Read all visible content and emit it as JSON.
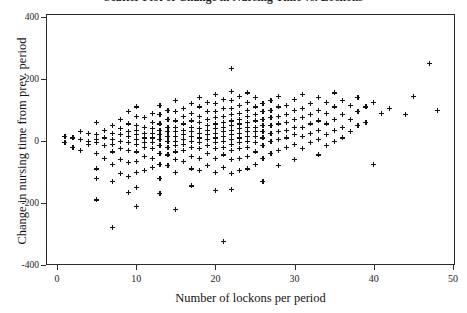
{
  "chart_data": {
    "type": "scatter",
    "title": "Scatter Plot of Change in Nursing Time vs. Lockons",
    "xlabel": "Number of lockons per period",
    "ylabel": "Change in nursing time from prev. period",
    "xlim": [
      -2,
      51.5
    ],
    "ylim": [
      -430,
      430
    ],
    "xticks": [
      0,
      10,
      20,
      30,
      40,
      50
    ],
    "yticks": [
      400,
      200,
      0,
      -200,
      -400
    ],
    "xticklabels": [
      "0",
      "10",
      "20",
      "30",
      "40",
      "50"
    ],
    "yticklabels": [
      "400",
      "200",
      "0",
      "-200",
      "-400"
    ],
    "grid": false,
    "legend": null,
    "marker": "plus",
    "marker_color": "#121212",
    "marker_size": 5,
    "background": "#ffffff",
    "frame_color": "#2b2b2b",
    "n_points": 298,
    "points": [
      [
        1,
        15
      ],
      [
        1,
        -5
      ],
      [
        2,
        10
      ],
      [
        2,
        -20
      ],
      [
        3,
        30
      ],
      [
        3,
        5
      ],
      [
        3,
        -30
      ],
      [
        4,
        25
      ],
      [
        4,
        0
      ],
      [
        4,
        -10
      ],
      [
        5,
        60
      ],
      [
        5,
        20
      ],
      [
        5,
        5
      ],
      [
        5,
        -5
      ],
      [
        5,
        -40
      ],
      [
        5,
        -90
      ],
      [
        5,
        -120
      ],
      [
        5,
        -190
      ],
      [
        6,
        35
      ],
      [
        6,
        10
      ],
      [
        6,
        -15
      ],
      [
        6,
        -55
      ],
      [
        7,
        50
      ],
      [
        7,
        25
      ],
      [
        7,
        5
      ],
      [
        7,
        -10
      ],
      [
        7,
        -35
      ],
      [
        7,
        -75
      ],
      [
        7,
        -130
      ],
      [
        7,
        -280
      ],
      [
        8,
        70
      ],
      [
        8,
        40
      ],
      [
        8,
        20
      ],
      [
        8,
        0
      ],
      [
        8,
        -25
      ],
      [
        8,
        -60
      ],
      [
        8,
        -105
      ],
      [
        9,
        95
      ],
      [
        9,
        55
      ],
      [
        9,
        30
      ],
      [
        9,
        15
      ],
      [
        9,
        -5
      ],
      [
        9,
        -30
      ],
      [
        9,
        -70
      ],
      [
        9,
        -115
      ],
      [
        9,
        -165
      ],
      [
        10,
        110
      ],
      [
        10,
        80
      ],
      [
        10,
        50
      ],
      [
        10,
        35
      ],
      [
        10,
        20
      ],
      [
        10,
        5
      ],
      [
        10,
        -10
      ],
      [
        10,
        -35
      ],
      [
        10,
        -65
      ],
      [
        10,
        -100
      ],
      [
        10,
        -150
      ],
      [
        10,
        -210
      ],
      [
        11,
        75
      ],
      [
        11,
        45
      ],
      [
        11,
        25
      ],
      [
        11,
        10
      ],
      [
        11,
        -5
      ],
      [
        11,
        -20
      ],
      [
        11,
        -50
      ],
      [
        11,
        -95
      ],
      [
        12,
        90
      ],
      [
        12,
        60
      ],
      [
        12,
        40
      ],
      [
        12,
        25
      ],
      [
        12,
        10
      ],
      [
        12,
        -5
      ],
      [
        12,
        -25
      ],
      [
        12,
        -55
      ],
      [
        12,
        -85
      ],
      [
        13,
        115
      ],
      [
        13,
        85
      ],
      [
        13,
        55
      ],
      [
        13,
        35
      ],
      [
        13,
        20
      ],
      [
        13,
        5
      ],
      [
        13,
        -15
      ],
      [
        13,
        -40
      ],
      [
        13,
        -75
      ],
      [
        13,
        -120
      ],
      [
        13,
        -170
      ],
      [
        14,
        100
      ],
      [
        14,
        70
      ],
      [
        14,
        45
      ],
      [
        14,
        30
      ],
      [
        14,
        15
      ],
      [
        14,
        0
      ],
      [
        14,
        -20
      ],
      [
        14,
        -45
      ],
      [
        14,
        -80
      ],
      [
        15,
        130
      ],
      [
        15,
        95
      ],
      [
        15,
        65
      ],
      [
        15,
        45
      ],
      [
        15,
        30
      ],
      [
        15,
        15
      ],
      [
        15,
        0
      ],
      [
        15,
        -15
      ],
      [
        15,
        -35
      ],
      [
        15,
        -60
      ],
      [
        15,
        -100
      ],
      [
        15,
        -220
      ],
      [
        16,
        105
      ],
      [
        16,
        80
      ],
      [
        16,
        55
      ],
      [
        16,
        35
      ],
      [
        16,
        20
      ],
      [
        16,
        5
      ],
      [
        16,
        -10
      ],
      [
        16,
        -30
      ],
      [
        16,
        -65
      ],
      [
        17,
        120
      ],
      [
        17,
        90
      ],
      [
        17,
        65
      ],
      [
        17,
        45
      ],
      [
        17,
        30
      ],
      [
        17,
        15
      ],
      [
        17,
        0
      ],
      [
        17,
        -20
      ],
      [
        17,
        -50
      ],
      [
        17,
        -90
      ],
      [
        17,
        -145
      ],
      [
        18,
        140
      ],
      [
        18,
        110
      ],
      [
        18,
        80
      ],
      [
        18,
        60
      ],
      [
        18,
        40
      ],
      [
        18,
        25
      ],
      [
        18,
        10
      ],
      [
        18,
        -5
      ],
      [
        18,
        -25
      ],
      [
        18,
        -55
      ],
      [
        18,
        -95
      ],
      [
        19,
        125
      ],
      [
        19,
        95
      ],
      [
        19,
        70
      ],
      [
        19,
        50
      ],
      [
        19,
        35
      ],
      [
        19,
        20
      ],
      [
        19,
        5
      ],
      [
        19,
        -15
      ],
      [
        19,
        -40
      ],
      [
        19,
        -80
      ],
      [
        20,
        150
      ],
      [
        20,
        120
      ],
      [
        20,
        95
      ],
      [
        20,
        75
      ],
      [
        20,
        55
      ],
      [
        20,
        40
      ],
      [
        20,
        25
      ],
      [
        20,
        10
      ],
      [
        20,
        -5
      ],
      [
        20,
        -25
      ],
      [
        20,
        -55
      ],
      [
        20,
        -100
      ],
      [
        20,
        -160
      ],
      [
        21,
        135
      ],
      [
        21,
        105
      ],
      [
        21,
        80
      ],
      [
        21,
        60
      ],
      [
        21,
        45
      ],
      [
        21,
        30
      ],
      [
        21,
        15
      ],
      [
        21,
        0
      ],
      [
        21,
        -20
      ],
      [
        21,
        -45
      ],
      [
        21,
        -85
      ],
      [
        21,
        -325
      ],
      [
        22,
        235
      ],
      [
        22,
        160
      ],
      [
        22,
        130
      ],
      [
        22,
        105
      ],
      [
        22,
        85
      ],
      [
        22,
        65
      ],
      [
        22,
        50
      ],
      [
        22,
        35
      ],
      [
        22,
        20
      ],
      [
        22,
        5
      ],
      [
        22,
        -10
      ],
      [
        22,
        -30
      ],
      [
        22,
        -60
      ],
      [
        22,
        -105
      ],
      [
        22,
        -155
      ],
      [
        23,
        145
      ],
      [
        23,
        115
      ],
      [
        23,
        90
      ],
      [
        23,
        70
      ],
      [
        23,
        55
      ],
      [
        23,
        40
      ],
      [
        23,
        25
      ],
      [
        23,
        10
      ],
      [
        23,
        -5
      ],
      [
        23,
        -25
      ],
      [
        23,
        -55
      ],
      [
        23,
        -95
      ],
      [
        24,
        155
      ],
      [
        24,
        125
      ],
      [
        24,
        100
      ],
      [
        24,
        80
      ],
      [
        24,
        60
      ],
      [
        24,
        45
      ],
      [
        24,
        30
      ],
      [
        24,
        15
      ],
      [
        24,
        0
      ],
      [
        24,
        -20
      ],
      [
        24,
        -50
      ],
      [
        24,
        -90
      ],
      [
        25,
        140
      ],
      [
        25,
        110
      ],
      [
        25,
        85
      ],
      [
        25,
        65
      ],
      [
        25,
        45
      ],
      [
        25,
        30
      ],
      [
        25,
        15
      ],
      [
        25,
        -5
      ],
      [
        25,
        -35
      ],
      [
        25,
        -75
      ],
      [
        26,
        120
      ],
      [
        26,
        95
      ],
      [
        26,
        70
      ],
      [
        26,
        50
      ],
      [
        26,
        30
      ],
      [
        26,
        10
      ],
      [
        26,
        -15
      ],
      [
        26,
        -55
      ],
      [
        26,
        -130
      ],
      [
        27,
        130
      ],
      [
        27,
        100
      ],
      [
        27,
        75
      ],
      [
        27,
        50
      ],
      [
        27,
        25
      ],
      [
        27,
        0
      ],
      [
        27,
        -40
      ],
      [
        28,
        145
      ],
      [
        28,
        110
      ],
      [
        28,
        80
      ],
      [
        28,
        55
      ],
      [
        28,
        30
      ],
      [
        28,
        5
      ],
      [
        28,
        -30
      ],
      [
        28,
        -80
      ],
      [
        29,
        115
      ],
      [
        29,
        85
      ],
      [
        29,
        60
      ],
      [
        29,
        35
      ],
      [
        29,
        10
      ],
      [
        29,
        -20
      ],
      [
        30,
        135
      ],
      [
        30,
        100
      ],
      [
        30,
        70
      ],
      [
        30,
        45
      ],
      [
        30,
        20
      ],
      [
        30,
        -10
      ],
      [
        30,
        -60
      ],
      [
        31,
        150
      ],
      [
        31,
        105
      ],
      [
        31,
        75
      ],
      [
        31,
        45
      ],
      [
        31,
        15
      ],
      [
        31,
        -25
      ],
      [
        32,
        120
      ],
      [
        32,
        85
      ],
      [
        32,
        55
      ],
      [
        32,
        25
      ],
      [
        32,
        -5
      ],
      [
        33,
        140
      ],
      [
        33,
        100
      ],
      [
        33,
        65
      ],
      [
        33,
        35
      ],
      [
        33,
        5
      ],
      [
        33,
        -45
      ],
      [
        34,
        125
      ],
      [
        34,
        90
      ],
      [
        34,
        55
      ],
      [
        34,
        20
      ],
      [
        34,
        -15
      ],
      [
        35,
        155
      ],
      [
        35,
        110
      ],
      [
        35,
        70
      ],
      [
        35,
        35
      ],
      [
        35,
        0
      ],
      [
        36,
        130
      ],
      [
        36,
        85
      ],
      [
        36,
        45
      ],
      [
        36,
        10
      ],
      [
        37,
        115
      ],
      [
        37,
        70
      ],
      [
        37,
        30
      ],
      [
        38,
        140
      ],
      [
        38,
        95
      ],
      [
        38,
        50
      ],
      [
        39,
        110
      ],
      [
        39,
        60
      ],
      [
        40,
        125
      ],
      [
        40,
        -75
      ],
      [
        41,
        90
      ],
      [
        42,
        105
      ],
      [
        44,
        85
      ],
      [
        45,
        145
      ],
      [
        47,
        250
      ],
      [
        48,
        100
      ]
    ]
  }
}
